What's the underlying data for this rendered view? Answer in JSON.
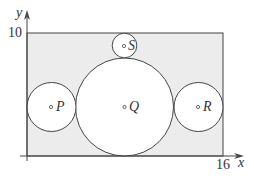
{
  "figure": {
    "type": "geometry-diagram",
    "colors": {
      "rectangle_fill": "#ececec",
      "circle_fill": "#ffffff",
      "stroke": "#444444",
      "text": "#333333"
    },
    "axes": {
      "x_label": "x",
      "y_label": "y",
      "x_tick": "16",
      "y_tick": "10"
    },
    "rectangle": {
      "x_min": 0,
      "x_max": 16,
      "y_min": 0,
      "y_max": 10
    },
    "circles": [
      {
        "name": "P",
        "label": "P",
        "center": [
          2,
          4
        ],
        "radius": 2
      },
      {
        "name": "Q",
        "label": "Q",
        "center": [
          8,
          4
        ],
        "radius": 4
      },
      {
        "name": "R",
        "label": "R",
        "center": [
          14,
          4
        ],
        "radius": 2
      },
      {
        "name": "S",
        "label": "S",
        "center": [
          8,
          9
        ],
        "radius": 1
      }
    ]
  }
}
